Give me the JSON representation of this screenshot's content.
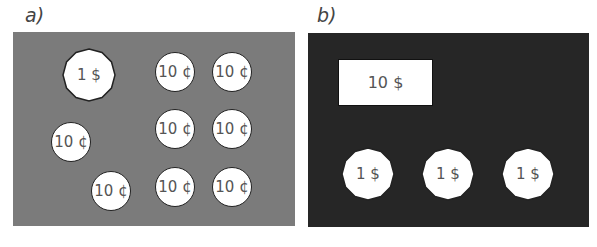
{
  "panels": [
    {
      "label": "a)",
      "background": "#7b7b7b",
      "dollar_coins": [
        {
          "text": "1 $"
        }
      ],
      "dime_coins": [
        {
          "text": "10 ¢"
        },
        {
          "text": "10 ¢"
        },
        {
          "text": "10 ¢"
        },
        {
          "text": "10 ¢"
        },
        {
          "text": "10 ¢"
        },
        {
          "text": "10 ¢"
        },
        {
          "text": "10 ¢"
        },
        {
          "text": "10 ¢"
        }
      ]
    },
    {
      "label": "b)",
      "background": "#262626",
      "bill": {
        "text": "10 $"
      },
      "dollar_coins": [
        {
          "text": "1 $"
        },
        {
          "text": "1 $"
        },
        {
          "text": "1 $"
        }
      ]
    }
  ]
}
